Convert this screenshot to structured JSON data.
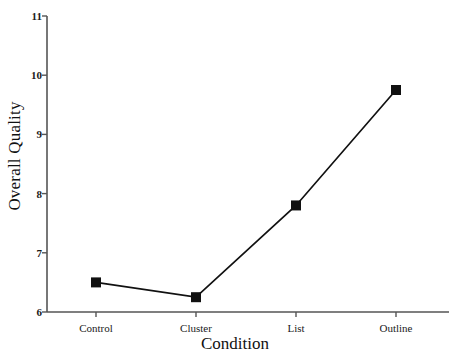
{
  "chart_data": {
    "type": "line",
    "title": "",
    "subtitle": "",
    "xlabel": "Condition",
    "ylabel": "Overall Quality",
    "categories": [
      "Control",
      "Cluster",
      "List",
      "Outline"
    ],
    "values": [
      6.5,
      6.25,
      7.8,
      9.75
    ],
    "series": [
      {
        "name": "Overall Quality",
        "values": [
          6.5,
          6.25,
          7.8,
          9.75
        ],
        "marker": "filled-square",
        "color": "#111111"
      }
    ],
    "ylim": [
      6,
      11
    ],
    "yticks": [
      6,
      7,
      8,
      9,
      10,
      11
    ],
    "ytick_labels": [
      "6",
      "7",
      "8",
      "9",
      "10",
      "11"
    ],
    "xtick_labels": [
      "Control",
      "Cluster",
      "List",
      "Outline"
    ],
    "grid": false,
    "legend": false,
    "legend_position": "none",
    "line_color": "#111111",
    "marker_color": "#111111",
    "axis_color": "#555555",
    "background": "#ffffff"
  },
  "axes": {
    "y_title": "Overall Quality",
    "x_title": "Condition"
  }
}
